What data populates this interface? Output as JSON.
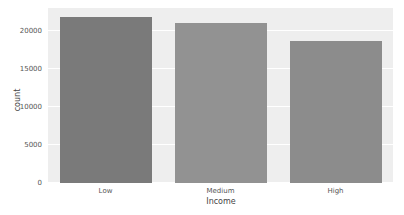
{
  "chart_data": {
    "type": "bar",
    "title": "",
    "xlabel": "Income",
    "ylabel": "count",
    "categories": [
      "Low",
      "Medium",
      "High"
    ],
    "values": [
      21850,
      21050,
      18700
    ],
    "colors": [
      "#7a7a7a",
      "#929292",
      "#8c8c8c"
    ],
    "ylim": [
      0,
      23000
    ],
    "yticks": [
      0,
      5000,
      10000,
      15000,
      20000
    ],
    "ytick_labels": [
      "0",
      "5000",
      "10000",
      "15000",
      "20000"
    ],
    "grid": true,
    "background": "#eeeeee",
    "legend": null
  }
}
